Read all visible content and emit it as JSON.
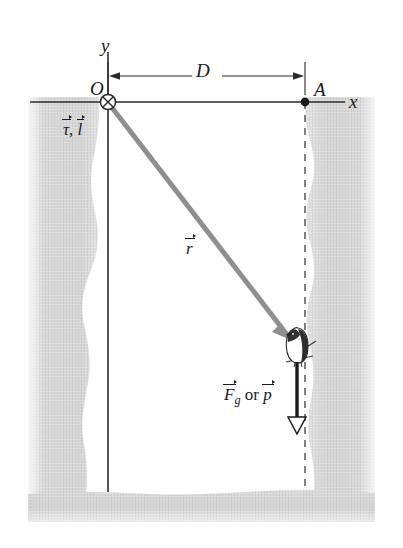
{
  "figure": {
    "background_color": "#ffffff",
    "rock_color": "#cfcfcf",
    "axis_color": "#2b2b2b",
    "r_vector_color": "#8c8c8c"
  },
  "labels": {
    "y_axis": "y",
    "x_axis": "x",
    "origin": "O",
    "point_a": "A",
    "distance": "D",
    "r_vector": "r",
    "torque_angular_momentum_tau": "τ",
    "torque_angular_momentum_l": "l",
    "force_symbol": "F",
    "force_subscript": "g",
    "force_conjunction": "or",
    "momentum_symbol": "p"
  },
  "geometry": {
    "origin_x": 108,
    "origin_y": 102,
    "point_a_x": 305,
    "point_a_y": 102,
    "particle_x": 297,
    "particle_y": 345,
    "x_axis_start": 30,
    "x_axis_end": 345,
    "y_axis_top": 52,
    "y_axis_bottom": 492,
    "dimension_line_y": 76,
    "force_arrow_top": 362,
    "force_arrow_bottom": 434,
    "ground_y": 492
  },
  "elements": {
    "origin_marker": "circle-x-into-page-icon",
    "point_a_marker": "filled-dot-icon",
    "particle": "bird-icon",
    "force_arrow": "down-arrow-icon",
    "r_arrow": "r-vector-arrow-icon",
    "dimension_arrow": "double-headed-arrow-icon",
    "left_cliff": "rock-texture",
    "right_cliff": "rock-texture",
    "ground": "rock-texture"
  }
}
